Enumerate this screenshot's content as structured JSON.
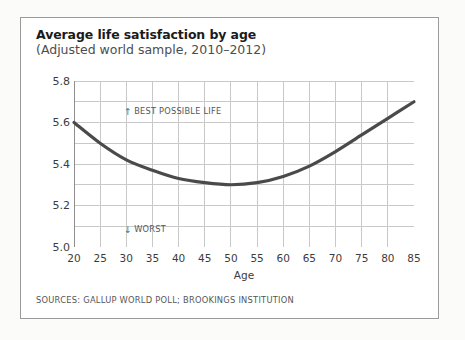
{
  "card": {
    "title_main": "Average life satisfaction by age",
    "title_sub": "(Adjusted world sample, 2010–2012)",
    "sources": "SOURCES: GALLUP WORLD POLL; BROOKINGS INSTITUTION"
  },
  "annotations": {
    "best": {
      "arrow": "↑",
      "label": "BEST POSSIBLE LIFE"
    },
    "worst": {
      "arrow": "↓",
      "label": "WORST"
    }
  },
  "colors": {
    "curve": "#4a4a4a",
    "grid": "#c9c9c9",
    "axis": "#8e8e8e",
    "card_border": "#9a9a9a",
    "page_background": "#fbfbfa",
    "card_background": "#ffffff",
    "title_text": "#1b1b1b",
    "subtitle_text": "#4d4d4d",
    "tick_text": "#3c3c3c",
    "annotation_text": "#55565a"
  },
  "chart_data": {
    "type": "line",
    "title": "Average life satisfaction by age",
    "subtitle": "(Adjusted world sample, 2010–2012)",
    "xlabel": "Age",
    "ylabel": "",
    "xlim": [
      20,
      85
    ],
    "ylim": [
      5.0,
      5.8
    ],
    "xticks": [
      20,
      25,
      30,
      35,
      40,
      45,
      50,
      55,
      60,
      65,
      70,
      75,
      80,
      85
    ],
    "yticks": [
      5.0,
      5.2,
      5.4,
      5.6,
      5.8
    ],
    "ytick_labels": [
      "5.0",
      "5.2",
      "5.4",
      "5.6",
      "5.8"
    ],
    "minor_y_gridlines": [
      5.1,
      5.3,
      5.5,
      5.7
    ],
    "grid": true,
    "legend": false,
    "series": [
      {
        "name": "Average life satisfaction",
        "x": [
          20,
          25,
          30,
          35,
          40,
          45,
          50,
          55,
          60,
          65,
          70,
          75,
          80,
          85
        ],
        "values": [
          5.6,
          5.5,
          5.42,
          5.37,
          5.33,
          5.31,
          5.3,
          5.31,
          5.34,
          5.39,
          5.46,
          5.54,
          5.62,
          5.7
        ]
      }
    ],
    "annotations": [
      {
        "text": "↑ BEST POSSIBLE LIFE",
        "x": 22,
        "y": 5.72
      },
      {
        "text": "↓ WORST",
        "x": 22,
        "y": 5.1
      }
    ],
    "minimum": {
      "age": 50,
      "value": 5.3
    }
  }
}
